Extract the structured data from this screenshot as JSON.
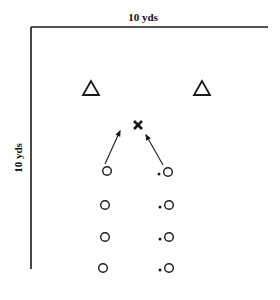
{
  "diagram": {
    "top_label": "10 yds",
    "side_label": "10 yds",
    "colors": {
      "ink": "#1a1a1a",
      "background": "#ffffff"
    },
    "field_boundary": {
      "corner": [
        31,
        27
      ],
      "top_end_x": 268,
      "left_end_y": 269
    },
    "cones": [
      {
        "name": "left-cone",
        "shape": "triangle",
        "x": 91,
        "y": 88
      },
      {
        "name": "right-cone",
        "shape": "triangle",
        "x": 202,
        "y": 88
      }
    ],
    "target": {
      "name": "target-x",
      "shape": "x",
      "x": 138,
      "y": 125
    },
    "arrows": [
      {
        "name": "left-line-run-arrow",
        "from": [
          105,
          164
        ],
        "to": [
          120,
          131
        ]
      },
      {
        "name": "right-line-run-arrow",
        "from": [
          163,
          165
        ],
        "to": [
          146,
          135
        ]
      }
    ],
    "left_line_players": [
      {
        "x": 107,
        "y": 171
      },
      {
        "x": 105,
        "y": 205
      },
      {
        "x": 105,
        "y": 237
      },
      {
        "x": 103,
        "y": 268
      }
    ],
    "right_line_players": [
      {
        "x": 168,
        "y": 172,
        "has_ball": true
      },
      {
        "x": 169,
        "y": 205,
        "has_ball": true
      },
      {
        "x": 169,
        "y": 237,
        "has_ball": true
      },
      {
        "x": 169,
        "y": 268,
        "has_ball": true
      }
    ]
  }
}
